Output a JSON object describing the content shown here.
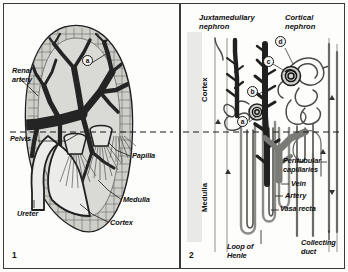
{
  "figure": {
    "panels": [
      {
        "number": "1",
        "name": "kidney-gross-anatomy",
        "labels": [
          {
            "id": "renal-artery",
            "text": "Renal\nartery",
            "x": 8,
            "y": 63
          },
          {
            "id": "pelvis",
            "text": "Pelvis",
            "x": 6,
            "y": 133
          },
          {
            "id": "ureter",
            "text": "Ureter",
            "x": 13,
            "y": 206
          },
          {
            "id": "papilla",
            "text": "Papilla",
            "x": 128,
            "y": 150
          },
          {
            "id": "medulla",
            "text": "Medulla",
            "x": 119,
            "y": 193
          },
          {
            "id": "cortex",
            "text": "Cortex",
            "x": 106,
            "y": 216
          }
        ],
        "markers": [
          {
            "id": "marker-a",
            "text": "a",
            "x": 78,
            "y": 57
          }
        ]
      },
      {
        "number": "2",
        "name": "nephron-detail",
        "headings": [
          {
            "id": "juxtamedullary-nephron",
            "text": "Juxtamedullary\nnephron",
            "x": 196,
            "y": 12
          },
          {
            "id": "cortical-nephron",
            "text": "Cortical\nnephron",
            "x": 280,
            "y": 12
          }
        ],
        "zones": [
          {
            "id": "cortex-zone",
            "text": "Cortex",
            "x": 186,
            "y": 100
          },
          {
            "id": "medulla-zone",
            "text": "Medulla",
            "x": 186,
            "y": 205
          }
        ],
        "labels": [
          {
            "id": "peritubular-capillaries",
            "text": "Peritubular\ncapillaries",
            "x": 278,
            "y": 156
          },
          {
            "id": "vein",
            "text": "Vein",
            "x": 283,
            "y": 180
          },
          {
            "id": "artery",
            "text": "Artery",
            "x": 275,
            "y": 192
          },
          {
            "id": "vasa-recta",
            "text": "Vasa recta",
            "x": 270,
            "y": 205
          },
          {
            "id": "loop-of-henle",
            "text": "Loop of\nHenle",
            "x": 218,
            "y": 243
          },
          {
            "id": "collecting-duct",
            "text": "Collecting\nduct",
            "x": 300,
            "y": 239
          }
        ],
        "markers": [
          {
            "id": "marker-a2",
            "text": "a",
            "x": 237,
            "y": 116
          },
          {
            "id": "marker-b",
            "text": "b",
            "x": 248,
            "y": 86
          },
          {
            "id": "marker-c",
            "text": "c",
            "x": 262,
            "y": 56
          },
          {
            "id": "marker-d",
            "text": "d",
            "x": 274,
            "y": 38
          }
        ]
      }
    ],
    "colors": {
      "ink": "#1a1a1a",
      "vessel_dark": "#2b2b2b",
      "vessel_mid": "#7d7d7b",
      "tissue_fill": "#d5d5d2",
      "pale_fill": "#ececea",
      "strip": "#e9e9e7",
      "background": "#fdfdfc"
    }
  }
}
